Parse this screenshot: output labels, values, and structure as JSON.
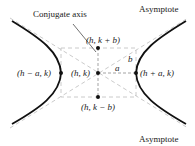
{
  "labels": {
    "conjugate_axis": "Conjugate axis",
    "asymptote_top": "Asymptote",
    "asymptote_bottom": "Asymptote",
    "top_point": "(h, k + b)",
    "bottom_point": "(h, k − b)",
    "center": "(h, k)",
    "left_vertex": "(h − a, k)",
    "right_vertex": "(h + a, k)",
    "a": "a",
    "b": "b"
  },
  "colors": {
    "curve": "#111111",
    "dashed": "#bbbbbb",
    "axis_dashed": "#999999",
    "text": "#222222"
  }
}
